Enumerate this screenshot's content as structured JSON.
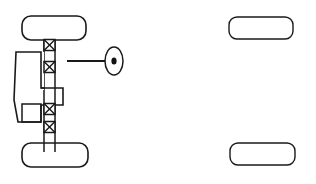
{
  "figure": {
    "title": "Vehicle drivetrain / axle schematic (plan view)",
    "background_color": "#ffffff",
    "line_color": "#1a1a1a",
    "width": 316,
    "height": 184
  },
  "wheels": [
    {
      "name": "front-left-wheel",
      "x": 22,
      "y": 16,
      "width": 64,
      "height": 24,
      "corner_radius": 9
    },
    {
      "name": "front-right-wheel",
      "x": 229,
      "y": 17,
      "width": 64,
      "height": 22,
      "corner_radius": 8
    },
    {
      "name": "rear-left-wheel",
      "x": 22,
      "y": 143,
      "width": 66,
      "height": 24,
      "corner_radius": 9
    },
    {
      "name": "rear-right-wheel",
      "x": 230,
      "y": 143,
      "width": 65,
      "height": 22,
      "corner_radius": 8
    }
  ],
  "shaft": {
    "name": "drive-shaft",
    "left_x": 44,
    "right_x": 55,
    "top_y": 40,
    "bottom_y": 152
  },
  "joints": [
    {
      "name": "universal-joint-1",
      "cx": 49.5,
      "cy": 45,
      "size": 11,
      "symbol": "x-in-square"
    },
    {
      "name": "universal-joint-2",
      "cx": 49.5,
      "cy": 67,
      "size": 11,
      "symbol": "x-in-square"
    },
    {
      "name": "universal-joint-3",
      "cx": 49.5,
      "cy": 109,
      "size": 11,
      "symbol": "x-in-square"
    },
    {
      "name": "universal-joint-4",
      "cx": 49.5,
      "cy": 127,
      "size": 11,
      "symbol": "x-in-square"
    }
  ],
  "gearbox": {
    "name": "differential-housing",
    "description": "L-shaped transfer case / differential body on the left of the shaft"
  },
  "callout": {
    "name": "detail-callout-marker",
    "ellipse_cx": 114,
    "ellipse_cy": 61,
    "ellipse_rx": 9,
    "ellipse_ry": 14,
    "center_dot_rx": 2.6,
    "center_dot_ry": 3.6,
    "leader_line": {
      "x1": 67,
      "y1": 61,
      "x2": 112,
      "y2": 61
    },
    "label": ""
  },
  "labels": []
}
